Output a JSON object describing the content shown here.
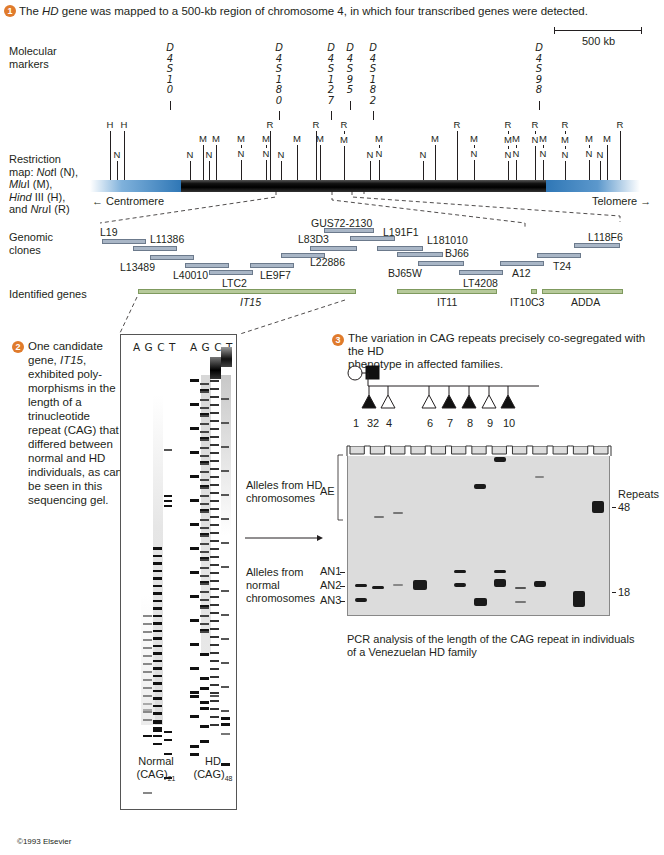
{
  "step1": {
    "number": "1",
    "text_prefix": "The ",
    "text_italic": "HD",
    "text_suffix": " gene was mapped to a 500-kb region of chromosome 4, in which four transcribed genes were detected."
  },
  "scale_bar": {
    "label": "500 kb"
  },
  "labels": {
    "molecular_markers": "Molecular markers",
    "restriction_map_lines": [
      "Restriction",
      "map: NotI (N),",
      "MluI (M),",
      "Hind III (H),",
      "and NruI (R)"
    ],
    "genomic_clones": "Genomic clones",
    "identified_genes": "Identified genes",
    "centromere": "Centromere",
    "telomere": "Telomere"
  },
  "molecular_markers": [
    {
      "name": "D4S10",
      "x": 170
    },
    {
      "name": "D4S180",
      "x": 279
    },
    {
      "name": "D4S127",
      "x": 331
    },
    {
      "name": "D4S95",
      "x": 350
    },
    {
      "name": "D4S182",
      "x": 373
    },
    {
      "name": "D4S98",
      "x": 539
    }
  ],
  "restriction_sites": [
    {
      "x": 110,
      "labels": [
        "H"
      ],
      "h": 1
    },
    {
      "x": 117,
      "labels": [
        "N"
      ],
      "h": 3
    },
    {
      "x": 124,
      "labels": [
        "H"
      ],
      "h": 1
    },
    {
      "x": 190,
      "labels": [
        "N"
      ],
      "h": 3
    },
    {
      "x": 203,
      "labels": [
        "M"
      ],
      "h": 2
    },
    {
      "x": 209,
      "labels": [
        "N"
      ],
      "h": 3
    },
    {
      "x": 216,
      "labels": [
        "M"
      ],
      "h": 2
    },
    {
      "x": 241,
      "labels": [
        "M",
        "N"
      ],
      "h": 2
    },
    {
      "x": 266,
      "labels": [
        "M",
        "N"
      ],
      "h": 2
    },
    {
      "x": 270,
      "labels": [
        "R"
      ],
      "h": 1
    },
    {
      "x": 281,
      "labels": [
        "N"
      ],
      "h": 3
    },
    {
      "x": 297,
      "labels": [
        "M"
      ],
      "h": 2
    },
    {
      "x": 316,
      "labels": [
        "R"
      ],
      "h": 1
    },
    {
      "x": 320,
      "labels": [
        "M"
      ],
      "h": 2
    },
    {
      "x": 344,
      "labels": [
        "R",
        "M"
      ],
      "h": 1
    },
    {
      "x": 370,
      "labels": [
        "N"
      ],
      "h": 3
    },
    {
      "x": 379,
      "labels": [
        "M",
        "N"
      ],
      "h": 2
    },
    {
      "x": 423,
      "labels": [
        "N"
      ],
      "h": 3
    },
    {
      "x": 435,
      "labels": [
        "M"
      ],
      "h": 2
    },
    {
      "x": 457,
      "labels": [
        "R"
      ],
      "h": 1
    },
    {
      "x": 474,
      "labels": [
        "M",
        "N"
      ],
      "h": 2
    },
    {
      "x": 508,
      "labels": [
        "R",
        "M",
        "N"
      ],
      "h": 1
    },
    {
      "x": 516,
      "labels": [
        "M",
        "N"
      ],
      "h": 2
    },
    {
      "x": 535,
      "labels": [
        "R",
        "N"
      ],
      "h": 1
    },
    {
      "x": 543,
      "labels": [
        "M",
        "N"
      ],
      "h": 2
    },
    {
      "x": 565,
      "labels": [
        "R",
        "M",
        "N"
      ],
      "h": 1
    },
    {
      "x": 589,
      "labels": [
        "M",
        "N"
      ],
      "h": 2
    },
    {
      "x": 600,
      "labels": [
        "N"
      ],
      "h": 3
    },
    {
      "x": 607,
      "labels": [
        "M"
      ],
      "h": 2
    },
    {
      "x": 620,
      "labels": [
        "R"
      ],
      "h": 1
    }
  ],
  "genomic_clones": [
    {
      "name": "L19",
      "x": 102,
      "y": 239,
      "w": 44,
      "lx": 100,
      "ly": 226
    },
    {
      "name": "L11386",
      "x": 133,
      "y": 246,
      "w": 44,
      "lx": 150,
      "ly": 233
    },
    {
      "name": "L13489",
      "x": 150,
      "y": 255,
      "w": 44,
      "lx": 120,
      "ly": 261
    },
    {
      "name": "L40010",
      "x": 185,
      "y": 263,
      "w": 44,
      "lx": 173,
      "ly": 269
    },
    {
      "name": "LTC2",
      "x": 209,
      "y": 270,
      "w": 44,
      "lx": 222,
      "ly": 277
    },
    {
      "name": "LE9F7",
      "x": 250,
      "y": 263,
      "w": 44,
      "lx": 260,
      "ly": 269
    },
    {
      "name": "L22886",
      "x": 281,
      "y": 253,
      "w": 44,
      "lx": 310,
      "ly": 256
    },
    {
      "name": "L83D3",
      "x": 310,
      "y": 246,
      "w": 47,
      "lx": 298,
      "ly": 233
    },
    {
      "name": "GUS72-2130",
      "x": 324,
      "y": 228,
      "w": 50,
      "lx": 311,
      "ly": 217
    },
    {
      "name": "L191F1",
      "x": 350,
      "y": 236,
      "w": 45,
      "lx": 383,
      "ly": 226
    },
    {
      "name": "L181010",
      "x": 377,
      "y": 246,
      "w": 46,
      "lx": 427,
      "ly": 234
    },
    {
      "name": "BJ66",
      "x": 397,
      "y": 252,
      "w": 46,
      "lx": 445,
      "ly": 247
    },
    {
      "name": "BJ65W",
      "x": 418,
      "y": 261,
      "w": 46,
      "lx": 388,
      "ly": 267
    },
    {
      "name": "LT4208",
      "x": 459,
      "y": 270,
      "w": 44,
      "lx": 463,
      "ly": 277
    },
    {
      "name": "A12",
      "x": 500,
      "y": 261,
      "w": 44,
      "lx": 512,
      "ly": 267
    },
    {
      "name": "T24",
      "x": 537,
      "y": 253,
      "w": 44,
      "lx": 553,
      "ly": 260
    },
    {
      "name": "L118F6",
      "x": 574,
      "y": 243,
      "w": 46,
      "lx": 588,
      "ly": 231
    }
  ],
  "identified_genes": [
    {
      "name": "IT15",
      "italic": true,
      "x": 138,
      "w": 218,
      "lx": 240
    },
    {
      "name": "IT11",
      "italic": false,
      "x": 397,
      "w": 100,
      "lx": 437
    },
    {
      "name": "IT10C3",
      "italic": false,
      "x": 531,
      "w": 6,
      "lx": 510
    },
    {
      "name": "ADDA",
      "italic": false,
      "x": 542,
      "w": 81,
      "lx": 571
    }
  ],
  "step2": {
    "number": "2",
    "lines": [
      "One candidate",
      "gene, IT15,",
      "exhibited poly-",
      "morphisms in the",
      "length of a",
      "trinucleotide",
      "repeat (CAG) that",
      "differed between",
      "normal and HD",
      "individuals, as can",
      "be seen in this",
      "sequencing gel."
    ]
  },
  "sequencing_gel": {
    "lane_headers_normal": [
      "A",
      "G",
      "C",
      "T"
    ],
    "lane_headers_hd": [
      "A",
      "G",
      "C",
      "T"
    ],
    "normal_label": "Normal",
    "normal_sub": "(CAG)",
    "normal_n": "21",
    "hd_label": "HD",
    "hd_sub": "(CAG)",
    "hd_n": "48"
  },
  "step3": {
    "number": "3",
    "lines": [
      "The variation in CAG repeats precisely co-segregated with the HD",
      "phenotype in affected families."
    ]
  },
  "pedigree": {
    "individuals": [
      {
        "id": "1",
        "shape": "circle",
        "affected": false
      },
      {
        "id": "2",
        "shape": "square",
        "affected": true
      },
      {
        "id": "3",
        "shape": "triangle",
        "affected": true
      },
      {
        "id": "4",
        "shape": "triangle",
        "affected": false
      },
      {
        "id": "6",
        "shape": "triangle",
        "affected": false
      },
      {
        "id": "7",
        "shape": "triangle",
        "affected": true
      },
      {
        "id": "8",
        "shape": "triangle",
        "affected": true
      },
      {
        "id": "9",
        "shape": "triangle",
        "affected": false
      },
      {
        "id": "10",
        "shape": "triangle",
        "affected": true
      }
    ]
  },
  "pcr_gel": {
    "left_labels": {
      "hd_alleles": [
        "Alleles from HD",
        "chromosomes"
      ],
      "ae": "AE",
      "normal_alleles": [
        "Alleles from",
        "normal",
        "chromosomes"
      ],
      "an1": "AN1",
      "an2": "AN2",
      "an3": "AN3"
    },
    "right_labels": {
      "repeats": "Repeats",
      "r48": "48",
      "r18": "18"
    },
    "caption_lines": [
      "PCR analysis of the length of the CAG repeat in individuals",
      "of a Venezuelan HD family"
    ]
  },
  "copyright": "©1993 Elsevier"
}
